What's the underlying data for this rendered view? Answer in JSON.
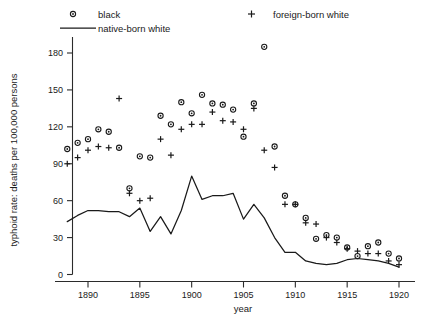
{
  "chart_data": {
    "type": "scatter",
    "title": "",
    "xlabel": "year",
    "ylabel": "typhoid rate: deaths per 100,000 persons",
    "xlim": [
      1888,
      1921
    ],
    "ylim": [
      0,
      190
    ],
    "xticks": [
      1890,
      1895,
      1900,
      1905,
      1910,
      1915,
      1920
    ],
    "xticklabels": [
      "1890",
      "1895",
      "1900",
      "1905",
      "1910",
      "1915",
      "1920"
    ],
    "yticks": [
      0,
      30,
      60,
      90,
      120,
      150,
      180
    ],
    "yticklabels": [
      "0",
      "30",
      "60",
      "90",
      "120",
      "150",
      "180"
    ],
    "grid": false,
    "legend_position": "top",
    "series": [
      {
        "name": "black",
        "marker": "circle",
        "x": [
          1888,
          1889,
          1890,
          1891,
          1892,
          1893,
          1894,
          1895,
          1896,
          1897,
          1898,
          1899,
          1900,
          1901,
          1902,
          1903,
          1904,
          1905,
          1906,
          1907,
          1908,
          1909,
          1910,
          1911,
          1912,
          1913,
          1914,
          1915,
          1916,
          1917,
          1918,
          1919,
          1920
        ],
        "y": [
          102,
          107,
          110,
          118,
          116,
          103,
          70,
          96,
          95,
          129,
          122,
          140,
          131,
          146,
          139,
          138,
          134,
          112,
          139,
          185,
          104,
          64,
          57,
          46,
          29,
          32,
          30,
          22,
          15,
          23,
          26,
          17,
          13
        ],
        "color": "#1a1a1a"
      },
      {
        "name": "foreign-born white",
        "marker": "plus",
        "x": [
          1888,
          1889,
          1890,
          1891,
          1892,
          1893,
          1894,
          1895,
          1896,
          1897,
          1898,
          1899,
          1900,
          1901,
          1902,
          1903,
          1904,
          1905,
          1906,
          1907,
          1908,
          1909,
          1910,
          1911,
          1912,
          1913,
          1914,
          1915,
          1916,
          1917,
          1918,
          1919,
          1920
        ],
        "y": [
          90,
          95,
          101,
          104,
          103,
          143,
          66,
          60,
          62,
          110,
          97,
          118,
          122,
          122,
          132,
          125,
          124,
          118,
          135,
          101,
          87,
          57,
          57,
          42,
          41,
          30,
          26,
          21,
          19,
          17,
          17,
          11,
          8
        ],
        "color": "#1a1a1a"
      },
      {
        "name": "native-born white",
        "marker": "line",
        "x": [
          1888,
          1889,
          1890,
          1891,
          1892,
          1893,
          1894,
          1895,
          1896,
          1897,
          1898,
          1899,
          1900,
          1901,
          1902,
          1903,
          1904,
          1905,
          1906,
          1907,
          1908,
          1909,
          1910,
          1911,
          1912,
          1913,
          1914,
          1915,
          1916,
          1917,
          1918,
          1919,
          1920
        ],
        "y": [
          43,
          48,
          52,
          52,
          51,
          51,
          47,
          54,
          35,
          47,
          33,
          52,
          80,
          61,
          64,
          64,
          66,
          45,
          57,
          46,
          30,
          18,
          18,
          11,
          9,
          8,
          9,
          12,
          13,
          12,
          11,
          9,
          6
        ],
        "color": "#1a1a1a"
      }
    ]
  },
  "legend": {
    "items": [
      {
        "label": "black",
        "marker": "circle"
      },
      {
        "label": "native-born white",
        "marker": "line"
      },
      {
        "label": "foreign-born white",
        "marker": "plus"
      }
    ]
  }
}
